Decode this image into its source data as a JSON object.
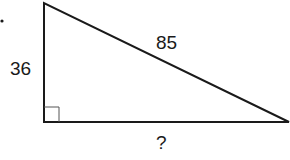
{
  "diagram": {
    "type": "right-triangle",
    "labels": {
      "vertical_leg": "36",
      "hypotenuse": "85",
      "horizontal_leg": "?"
    },
    "colors": {
      "stroke": "#1a1a1a",
      "right_angle_marker": "#555555",
      "background": "#ffffff"
    }
  }
}
